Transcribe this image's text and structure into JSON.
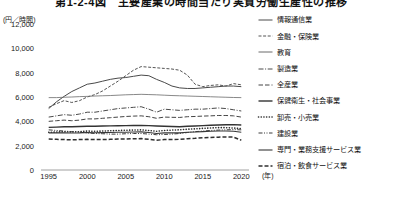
{
  "chart_data": {
    "type": "line",
    "title": "第1-2-4図　主要産業の時間当たり実質労働生産性の推移",
    "ylabel": "(円／時間)",
    "xlabel": "(年)",
    "ylim": [
      0,
      12000
    ],
    "ytick_labels": [
      "0",
      "2,000",
      "4,000",
      "6,000",
      "8,000",
      "10,000",
      "12,000"
    ],
    "ytick_values": [
      0,
      2000,
      4000,
      6000,
      8000,
      10000,
      12000
    ],
    "xlim": [
      1994,
      2021
    ],
    "xtick_labels": [
      "1995",
      "2000",
      "2005",
      "2010",
      "2015",
      "2020"
    ],
    "xtick_values": [
      1995,
      2000,
      2005,
      2010,
      2015,
      2020
    ],
    "grid": false,
    "legend_position": "right",
    "x": [
      1995,
      1996,
      1997,
      1998,
      1999,
      2000,
      2001,
      2002,
      2003,
      2004,
      2005,
      2006,
      2007,
      2008,
      2009,
      2010,
      2011,
      2012,
      2013,
      2014,
      2015,
      2016,
      2017,
      2018,
      2019,
      2020
    ],
    "series": [
      {
        "name": "情報通信業",
        "style": "solid",
        "color": "#4a4a4a",
        "width": 1.0,
        "values": [
          5050,
          5600,
          6050,
          6450,
          6750,
          7050,
          7150,
          7300,
          7450,
          7550,
          7600,
          7700,
          7800,
          7750,
          7450,
          7200,
          6900,
          6750,
          6700,
          6700,
          6750,
          6800,
          6850,
          6900,
          6900,
          6850
        ]
      },
      {
        "name": "金融・保険業",
        "style": "dashed",
        "color": "#555555",
        "width": 1.0,
        "values": [
          5150,
          5450,
          5700,
          5550,
          5700,
          6000,
          6200,
          6500,
          6900,
          7300,
          7750,
          8200,
          8500,
          8450,
          8400,
          8350,
          8300,
          8200,
          7800,
          7050,
          6850,
          6950,
          7000,
          6900,
          7100,
          7000
        ]
      },
      {
        "name": "教育",
        "style": "solid-thin",
        "color": "#6a6a6a",
        "width": 0.8,
        "values": [
          5950,
          5950,
          5980,
          6000,
          6030,
          6050,
          6080,
          6100,
          6120,
          6150,
          6180,
          6200,
          6220,
          6200,
          6180,
          6150,
          6120,
          6100,
          6080,
          6060,
          6040,
          6020,
          6000,
          5980,
          5960,
          5950
        ]
      },
      {
        "name": "製造業",
        "style": "dashdot",
        "color": "#4a4a4a",
        "width": 1.0,
        "values": [
          4350,
          4450,
          4550,
          4500,
          4600,
          4750,
          4750,
          4850,
          4950,
          5050,
          5100,
          5150,
          5200,
          5000,
          4750,
          5000,
          4950,
          4900,
          4950,
          5000,
          5000,
          5050,
          5100,
          5050,
          4950,
          4850
        ]
      },
      {
        "name": "全産業",
        "style": "dashed-long",
        "color": "#444444",
        "width": 1.0,
        "values": [
          4000,
          4050,
          4100,
          4050,
          4100,
          4200,
          4200,
          4250,
          4300,
          4350,
          4400,
          4430,
          4450,
          4380,
          4250,
          4350,
          4330,
          4320,
          4380,
          4400,
          4430,
          4450,
          4480,
          4480,
          4450,
          4350
        ]
      },
      {
        "name": "保健衛生・社会事業",
        "style": "solid-thick",
        "color": "#333333",
        "width": 1.4,
        "values": [
          3500,
          3520,
          3550,
          3560,
          3580,
          3600,
          3600,
          3620,
          3630,
          3640,
          3650,
          3660,
          3670,
          3650,
          3620,
          3600,
          3580,
          3560,
          3600,
          3620,
          3650,
          3680,
          3700,
          3720,
          3730,
          3700
        ]
      },
      {
        "name": "卸売・小売業",
        "style": "dotted",
        "color": "#2a2a2a",
        "width": 1.6,
        "values": [
          3100,
          3120,
          3150,
          3130,
          3150,
          3200,
          3180,
          3200,
          3220,
          3250,
          3270,
          3280,
          3300,
          3250,
          3180,
          3250,
          3280,
          3300,
          3350,
          3380,
          3420,
          3450,
          3480,
          3480,
          3450,
          3400
        ]
      },
      {
        "name": "建設業",
        "style": "dashdotdot",
        "color": "#3a3a3a",
        "width": 1.0,
        "values": [
          3300,
          3250,
          3200,
          3150,
          3100,
          3050,
          3000,
          2980,
          2950,
          2950,
          2980,
          3000,
          3000,
          2950,
          2900,
          2920,
          2950,
          3000,
          3080,
          3150,
          3200,
          3250,
          3280,
          3300,
          3320,
          3300
        ]
      },
      {
        "name": "専門・業務支援サービス業",
        "style": "solid-med",
        "color": "#383838",
        "width": 1.1,
        "values": [
          3050,
          3050,
          3060,
          3040,
          3050,
          3080,
          3060,
          3070,
          3080,
          3100,
          3100,
          3120,
          3130,
          3080,
          3000,
          3050,
          3050,
          3050,
          3100,
          3120,
          3150,
          3180,
          3200,
          3200,
          3180,
          3100
        ]
      },
      {
        "name": "宿泊・飲食サービス業",
        "style": "dashed-thick",
        "color": "#2f2f2f",
        "width": 1.5,
        "values": [
          2550,
          2520,
          2500,
          2480,
          2500,
          2520,
          2500,
          2500,
          2520,
          2550,
          2550,
          2570,
          2580,
          2530,
          2450,
          2500,
          2500,
          2520,
          2570,
          2600,
          2650,
          2680,
          2700,
          2720,
          2700,
          2450
        ]
      }
    ]
  }
}
